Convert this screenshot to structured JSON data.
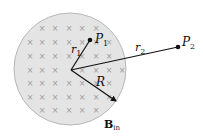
{
  "diagram": {
    "region": {
      "fill": "#e4e4e4",
      "stroke": "#b8b8b8",
      "center": [
        70,
        69
      ],
      "radius": 56
    },
    "field_symbol": "×",
    "field_color": "#9a9a9a",
    "field_grid": {
      "columns": [
        30,
        42,
        55,
        69,
        82,
        96,
        109,
        122
      ],
      "rows": [
        28,
        42,
        56,
        70,
        83,
        97,
        110
      ]
    },
    "origin": [
      71,
      70
    ],
    "points": [
      {
        "id": "P1",
        "label": "P",
        "subscript": "1",
        "pos": [
          90,
          40
        ]
      },
      {
        "id": "P2",
        "label": "P",
        "subscript": "2",
        "pos": [
          178,
          47
        ]
      }
    ],
    "vectors": [
      {
        "id": "r1",
        "label": "r",
        "subscript": "1",
        "to": [
          90,
          40
        ]
      },
      {
        "id": "r2",
        "label": "r",
        "subscript": "2",
        "to": [
          178,
          47
        ]
      },
      {
        "id": "R",
        "label": "R",
        "subscript": "",
        "to": [
          117,
          102
        ],
        "arrow": true
      }
    ],
    "field_label": {
      "main": "B",
      "subscript": "in"
    }
  }
}
